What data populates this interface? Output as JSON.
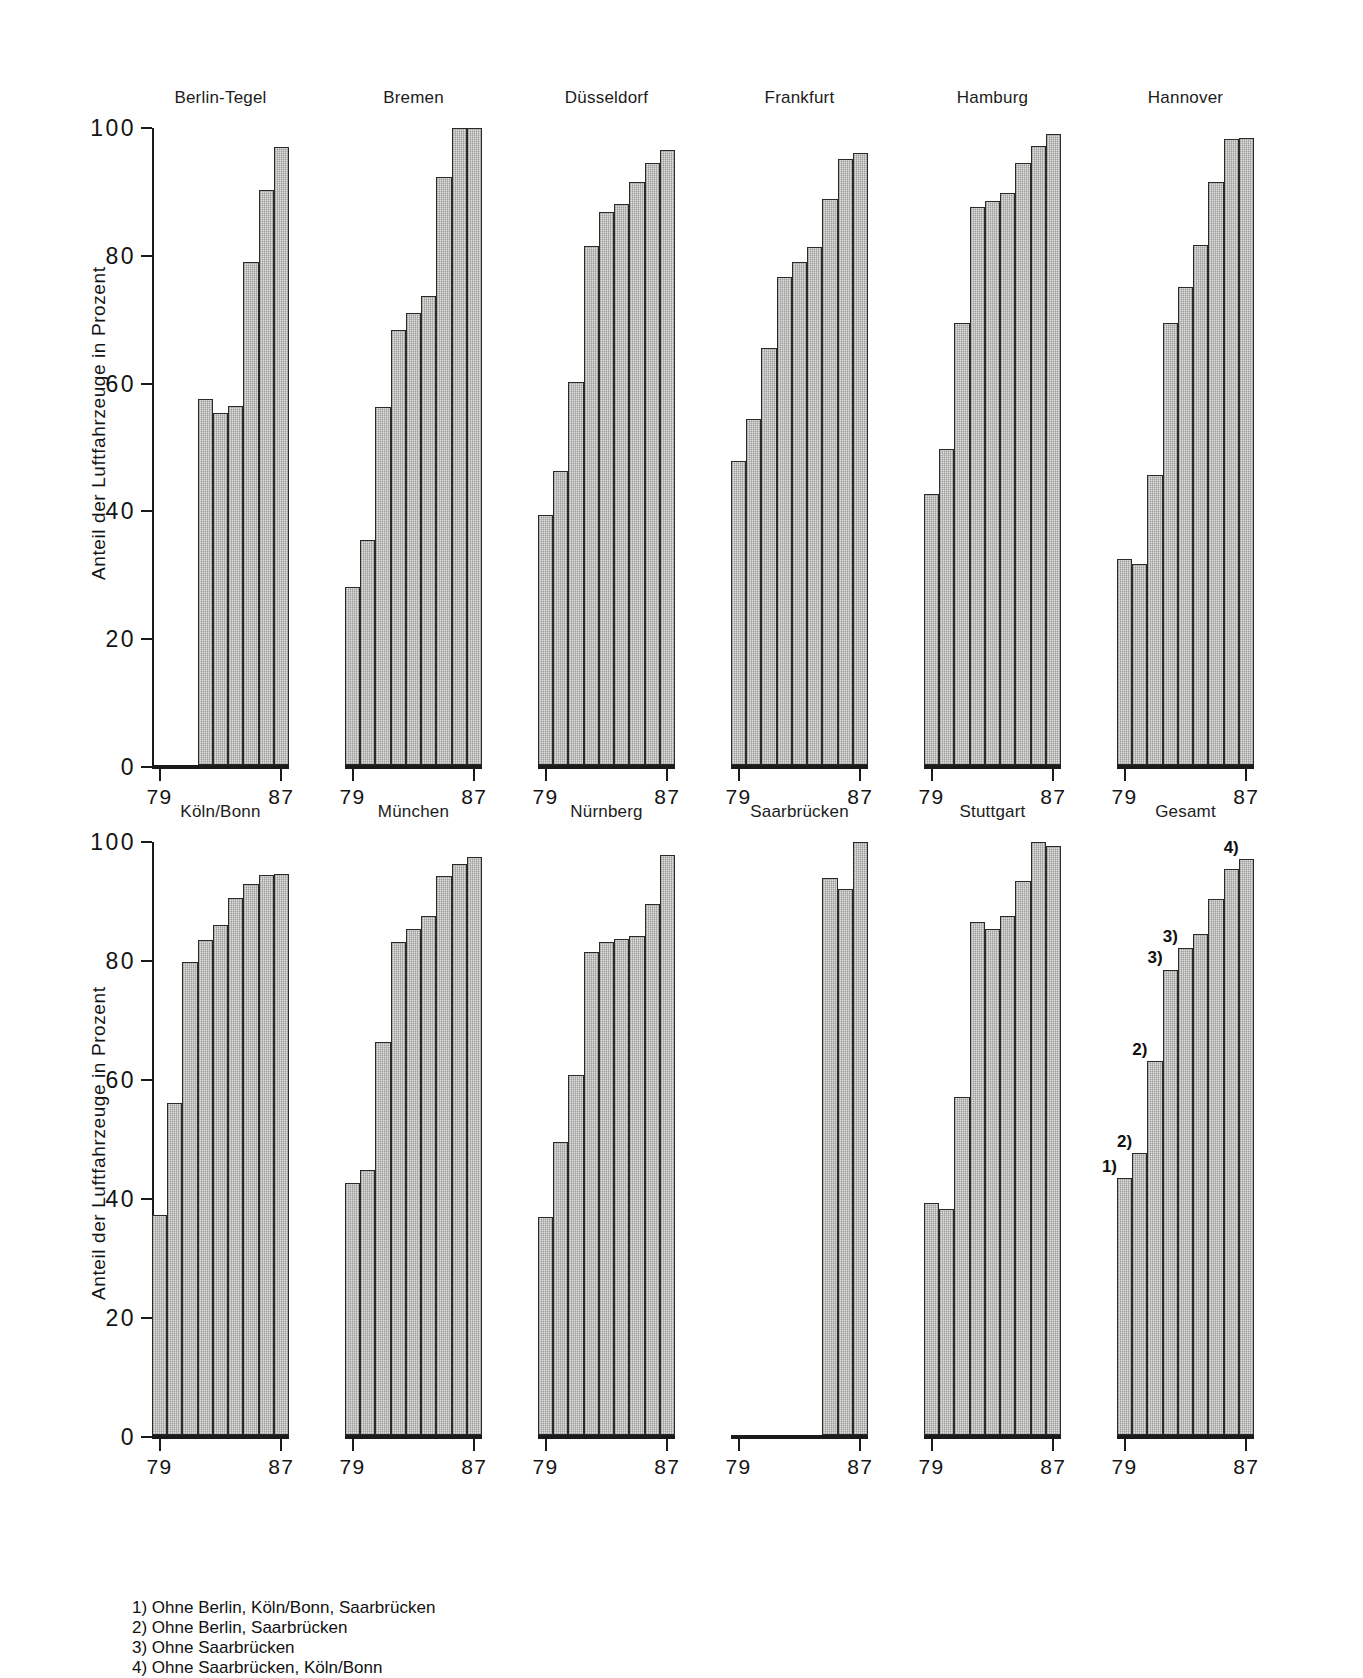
{
  "axis": {
    "ylabel": "Anteil der Luftfahrzeuge in Prozent",
    "yticks": [
      "0",
      "20",
      "40",
      "60",
      "80",
      "100"
    ],
    "xticks": [
      "79",
      "87"
    ]
  },
  "footnotes": [
    "1) Ohne Berlin, Köln/Bonn, Saarbrücken",
    "2) Ohne Berlin, Saarbrücken",
    "3) Ohne Saarbrücken",
    "4) Ohne Saarbrücken, Köln/Bonn"
  ],
  "chart_data": {
    "type": "bar",
    "title": "",
    "xlabel": "",
    "ylabel": "Anteil der Luftfahrzeuge in Prozent",
    "ylim": [
      0,
      100
    ],
    "yticks": [
      0,
      20,
      40,
      60,
      80,
      100
    ],
    "grid": false,
    "legend": null,
    "x": [
      "79",
      "80",
      "81",
      "82",
      "83",
      "84",
      "85",
      "86",
      "87"
    ],
    "xtick_labels": [
      "79",
      "87"
    ],
    "panel_layout": {
      "rows": 2,
      "cols": 6
    },
    "panels": [
      {
        "name": "Berlin-Tegel",
        "row": 1,
        "categories": [
          "79",
          "80",
          "81",
          "82",
          "83",
          "84",
          "85",
          "86",
          "87"
        ],
        "values": [
          null,
          null,
          null,
          57.5,
          55.2,
          56.3,
          79.0,
          90.3,
          97.0
        ],
        "annotations": []
      },
      {
        "name": "Bremen",
        "row": 1,
        "categories": [
          "79",
          "80",
          "81",
          "82",
          "83",
          "84",
          "85",
          "86",
          "87"
        ],
        "values": [
          28.0,
          35.3,
          56.2,
          68.3,
          71.0,
          73.6,
          92.3,
          100.0,
          100.0
        ],
        "annotations": []
      },
      {
        "name": "Düsseldorf",
        "row": 1,
        "categories": [
          "79",
          "80",
          "81",
          "82",
          "83",
          "84",
          "85",
          "86",
          "87"
        ],
        "values": [
          39.2,
          46.2,
          60.1,
          81.5,
          86.8,
          88.0,
          91.5,
          94.5,
          96.6
        ],
        "annotations": []
      },
      {
        "name": "Frankfurt",
        "row": 1,
        "categories": [
          "79",
          "80",
          "81",
          "82",
          "83",
          "84",
          "85",
          "86",
          "87"
        ],
        "values": [
          47.8,
          54.3,
          65.5,
          76.6,
          79.0,
          81.3,
          88.8,
          95.2,
          96.0
        ],
        "annotations": []
      },
      {
        "name": "Hamburg",
        "row": 1,
        "categories": [
          "79",
          "80",
          "81",
          "82",
          "83",
          "84",
          "85",
          "86",
          "87"
        ],
        "values": [
          42.6,
          49.6,
          69.4,
          87.6,
          88.5,
          89.8,
          94.5,
          97.2,
          99.0
        ],
        "annotations": []
      },
      {
        "name": "Hannover",
        "row": 1,
        "categories": [
          "79",
          "80",
          "81",
          "82",
          "83",
          "84",
          "85",
          "86",
          "87"
        ],
        "values": [
          32.4,
          31.6,
          45.5,
          69.4,
          75.0,
          81.6,
          91.5,
          98.2,
          98.5
        ],
        "annotations": []
      },
      {
        "name": "Köln/Bonn",
        "row": 2,
        "categories": [
          "79",
          "80",
          "81",
          "82",
          "83",
          "84",
          "85",
          "86",
          "87"
        ],
        "values": [
          37.1,
          56.0,
          79.7,
          83.5,
          86.0,
          90.5,
          93.0,
          94.4,
          94.6
        ],
        "annotations": []
      },
      {
        "name": "München",
        "row": 2,
        "categories": [
          "79",
          "80",
          "81",
          "82",
          "83",
          "84",
          "85",
          "86",
          "87"
        ],
        "values": [
          42.5,
          44.7,
          66.3,
          83.2,
          85.4,
          87.6,
          94.2,
          96.3,
          97.4
        ],
        "annotations": []
      },
      {
        "name": "Nürnberg",
        "row": 2,
        "categories": [
          "79",
          "80",
          "81",
          "82",
          "83",
          "84",
          "85",
          "86",
          "87"
        ],
        "values": [
          36.8,
          49.4,
          60.7,
          81.5,
          83.2,
          83.6,
          84.2,
          89.6,
          97.8
        ],
        "annotations": []
      },
      {
        "name": "Saarbrücken",
        "row": 2,
        "categories": [
          "79",
          "80",
          "81",
          "82",
          "83",
          "84",
          "85",
          "86",
          "87"
        ],
        "values": [
          null,
          null,
          null,
          null,
          null,
          null,
          94.0,
          92.0,
          100.0
        ],
        "annotations": []
      },
      {
        "name": "Stuttgart",
        "row": 2,
        "categories": [
          "79",
          "80",
          "81",
          "82",
          "83",
          "84",
          "85",
          "86",
          "87"
        ],
        "values": [
          39.2,
          38.1,
          57.0,
          86.5,
          85.3,
          87.5,
          93.4,
          100.0,
          99.4
        ],
        "annotations": []
      },
      {
        "name": "Gesamt",
        "row": 2,
        "categories": [
          "79",
          "80",
          "81",
          "82",
          "83",
          "84",
          "85",
          "86",
          "87"
        ],
        "values": [
          43.3,
          47.6,
          63.0,
          78.5,
          82.1,
          84.5,
          90.4,
          95.4,
          97.2
        ],
        "annotations": [
          {
            "index": 0,
            "label": "1)"
          },
          {
            "index": 1,
            "label": "2)"
          },
          {
            "index": 2,
            "label": "2)"
          },
          {
            "index": 3,
            "label": "3)"
          },
          {
            "index": 4,
            "label": "3)"
          },
          {
            "index": 8,
            "label": "4)"
          }
        ]
      }
    ]
  }
}
